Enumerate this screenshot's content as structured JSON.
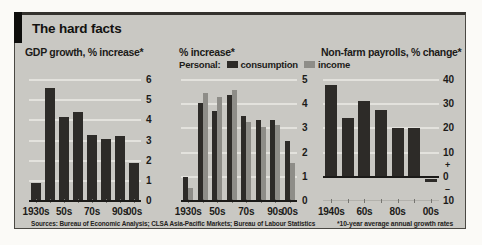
{
  "header": {
    "title": "The hard facts"
  },
  "footer": {
    "sources": "Sources: Bureau of Economic Analysis; CLSA Asia-Pacific Markets; Bureau of Labour Statistics",
    "footnote": "*10-year average annual growth rates"
  },
  "colors": {
    "page_bg": "#fbfaf7",
    "panel_bg": "#c9c8c3",
    "border": "#4a4843",
    "tab": "#0e0e0c",
    "grid": "#e3e2dd",
    "grid_light": "#b2b1ac",
    "zero_line": "#1b1a18",
    "dark_bar": "#2d2b28",
    "gray_bar": "#8e8d88",
    "text": "#1c1b19"
  },
  "chart_data": [
    {
      "type": "bar",
      "title": "GDP growth, % increase*",
      "categories": [
        "1930s",
        "1940s",
        "1950s",
        "1960s",
        "1970s",
        "1980s",
        "1990s",
        "2000s"
      ],
      "values": [
        0.9,
        5.6,
        4.15,
        4.4,
        3.25,
        3.05,
        3.2,
        1.9
      ],
      "ylim": [
        0,
        6
      ],
      "grid": true,
      "legend_position": "none",
      "yticks": [
        {
          "v": 6,
          "label": "6",
          "grid": true
        },
        {
          "v": 5,
          "label": "5",
          "grid": true
        },
        {
          "v": 4,
          "label": "4",
          "grid": true
        },
        {
          "v": 3,
          "label": "3",
          "grid": true
        },
        {
          "v": 2,
          "label": "2",
          "grid": true
        },
        {
          "v": 1,
          "label": "1",
          "grid": true
        },
        {
          "v": 0,
          "label": "0"
        }
      ],
      "xtick_labels": [
        {
          "slot": 0,
          "label": "1930s"
        },
        {
          "slot": 2,
          "label": "50s"
        },
        {
          "slot": 4,
          "label": "70s"
        },
        {
          "slot": 6,
          "label": "90s"
        },
        {
          "slot": 7,
          "label": "00s"
        }
      ],
      "x_axis_ticks": true
    },
    {
      "type": "bar",
      "title": "% increase*",
      "legend": {
        "prefix": "Personal:",
        "entries": [
          {
            "name": "consumption",
            "color": "dark"
          },
          {
            "name": "income",
            "color": "gray"
          }
        ]
      },
      "categories": [
        "1930s",
        "1940s",
        "1950s",
        "1960s",
        "1970s",
        "1980s",
        "1990s",
        "2000s"
      ],
      "series": [
        {
          "name": "consumption",
          "color": "dark",
          "values": [
            1.0,
            4.05,
            3.7,
            4.4,
            3.5,
            3.35,
            3.35,
            2.5
          ]
        },
        {
          "name": "income",
          "color": "gray",
          "values": [
            0.55,
            4.45,
            4.3,
            4.6,
            3.25,
            3.05,
            3.15,
            1.55
          ]
        }
      ],
      "ylim": [
        0,
        5
      ],
      "grid": true,
      "legend_position": "top",
      "yticks": [
        {
          "v": 5,
          "label": "5",
          "grid": true
        },
        {
          "v": 4,
          "label": "4",
          "grid": true
        },
        {
          "v": 3,
          "label": "3",
          "grid": true
        },
        {
          "v": 2,
          "label": "2",
          "grid": true
        },
        {
          "v": 1,
          "label": "1",
          "grid": true
        },
        {
          "v": 0,
          "label": "0"
        }
      ],
      "xtick_labels": [
        {
          "slot": 0,
          "label": "1930s"
        },
        {
          "slot": 2,
          "label": "50s"
        },
        {
          "slot": 4,
          "label": "70s"
        },
        {
          "slot": 6,
          "label": "90s"
        },
        {
          "slot": 7,
          "label": "00s"
        }
      ],
      "x_axis_ticks": true
    },
    {
      "type": "bar",
      "title": "Non-farm payrolls, % change*",
      "categories": [
        "1940s",
        "1950s",
        "1960s",
        "1970s",
        "1980s",
        "1990s",
        "2000s"
      ],
      "values": [
        38,
        24.5,
        31.5,
        27.5,
        20,
        20,
        -1.5
      ],
      "ylim": [
        -10,
        40
      ],
      "grid": true,
      "legend_position": "none",
      "yticks": [
        {
          "v": 40,
          "label": "40",
          "grid": true
        },
        {
          "v": 30,
          "label": "30",
          "grid": true
        },
        {
          "v": 20,
          "label": "20",
          "grid": true
        },
        {
          "v": 10,
          "label": "10",
          "grid": true
        },
        {
          "v": 5,
          "label": "+",
          "small": true
        },
        {
          "v": 0,
          "label": "0"
        },
        {
          "v": -5,
          "label": "–",
          "small": true
        },
        {
          "v": -10,
          "label": "10",
          "grid": true,
          "light": true
        }
      ],
      "xtick_labels": [
        {
          "slot": 0,
          "label": "1940s"
        },
        {
          "slot": 2,
          "label": "60s"
        },
        {
          "slot": 4,
          "label": "80s"
        },
        {
          "slot": 6,
          "label": "00s"
        }
      ],
      "x_axis_ticks": true
    }
  ]
}
